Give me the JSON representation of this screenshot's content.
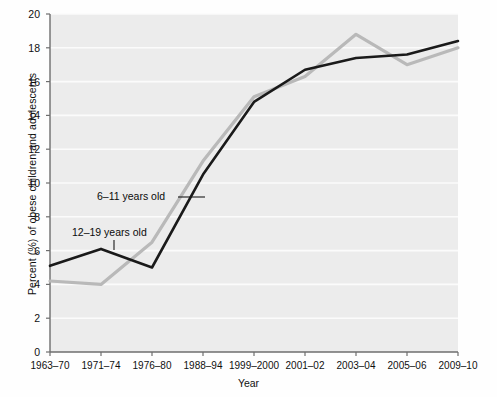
{
  "chart_data": {
    "type": "line",
    "title": "",
    "xlabel": "Year",
    "ylabel": "Percent (%) of obese children and adolescents",
    "categories": [
      "1963–70",
      "1971–74",
      "1976–80",
      "1988–94",
      "1999–2000",
      "2001–02",
      "2003–04",
      "2005–06",
      "2009–10"
    ],
    "ylim": [
      0,
      20
    ],
    "yticks": [
      0,
      2,
      4,
      6,
      8,
      10,
      12,
      14,
      16,
      18,
      20
    ],
    "ytick_labels": [
      "0",
      "2",
      "4",
      "6",
      "8",
      "10",
      "12",
      "14",
      "16",
      "18",
      "20"
    ],
    "grid": "horizontal",
    "legend_position": "inline-annotations",
    "series": [
      {
        "name": "6–11 years old",
        "color": "#b9b9b9",
        "values": [
          4.2,
          4.0,
          6.5,
          11.3,
          15.1,
          16.3,
          18.8,
          17.0,
          18.0
        ]
      },
      {
        "name": "12–19 years old",
        "color": "#1a1a1a",
        "values": [
          5.1,
          6.1,
          5.0,
          10.5,
          14.8,
          16.7,
          17.4,
          17.6,
          18.4
        ]
      }
    ],
    "annotations": [
      {
        "text": "6–11 years old",
        "series": "6–11 years old",
        "leader": "horizontal"
      },
      {
        "text": "12–19 years old",
        "series": "12–19 years old",
        "leader": "vertical"
      }
    ]
  },
  "colors": {
    "plot_background": "#ececec",
    "gridline": "#fbfbfb",
    "axis": "#6e6e6e",
    "text": "#101010",
    "series_6_11": "#b9b9b9",
    "series_12_19": "#1a1a1a"
  }
}
